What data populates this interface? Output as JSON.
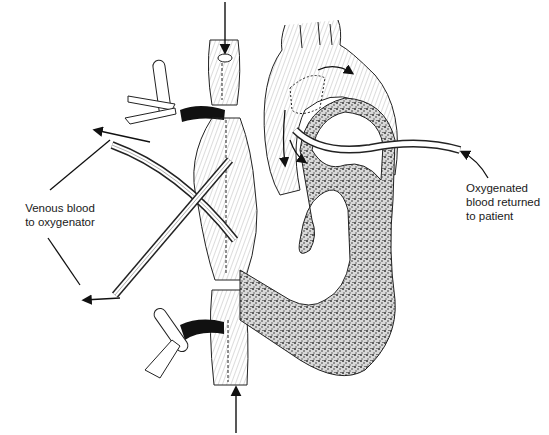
{
  "diagram": {
    "labels": {
      "venous": {
        "lines": [
          "Venous blood",
          "to oxygenator"
        ]
      },
      "oxygenated": {
        "lines": [
          "Oxygenated",
          "blood returned",
          "to patient"
        ]
      }
    },
    "colors": {
      "ink": "#1a1a1a",
      "background": "#ffffff",
      "stipple": "#3a3a3a"
    }
  }
}
